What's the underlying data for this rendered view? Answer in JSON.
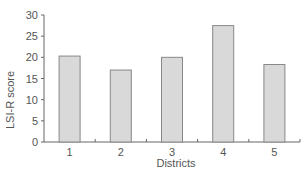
{
  "chart_data": {
    "type": "bar",
    "title": "",
    "xlabel": "Districts",
    "ylabel": "LSI-R score",
    "categories": [
      "1",
      "2",
      "3",
      "4",
      "5"
    ],
    "values": [
      20.3,
      17.0,
      20.0,
      27.5,
      18.3
    ],
    "ylim": [
      0,
      30
    ],
    "yticks": [
      0,
      5,
      10,
      15,
      20,
      25,
      30
    ],
    "grid": false,
    "legend": null,
    "bar_color": "#d9d9d9",
    "bar_edge_color": "#888888"
  }
}
